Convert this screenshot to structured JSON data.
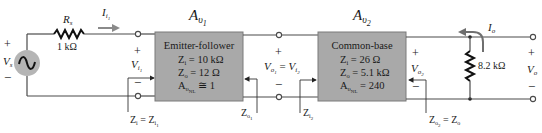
{
  "source": {
    "label": "V",
    "label_sub": "s",
    "plus": "+",
    "minus": "−",
    "fill": "#b5b5b5"
  },
  "source_resistor": {
    "name": "R",
    "name_sub": "s",
    "value": "1 kΩ"
  },
  "input_current": {
    "label": "I",
    "sub": "i",
    "subsub": "1",
    "arrow_color": "#8a8a8a"
  },
  "input_voltage": {
    "plus": "+",
    "minus": "−",
    "label": "V",
    "sub": "i",
    "subsub": "1"
  },
  "input_impedance": {
    "lhs": "Z",
    "lhs_sub": "i",
    "eq": " = ",
    "rhs": "Z",
    "rhs_sub": "i",
    "rhs_subsub": "1"
  },
  "stage1": {
    "gain_label": "A",
    "gain_sub": "υ",
    "gain_subsub": "1",
    "title": "Emitter-follower",
    "zi_sym": "Z",
    "zi_sub": "i",
    "zi_val": " = 10 kΩ",
    "zo_sym": "Z",
    "zo_sub": "o",
    "zo_val": " = 12 Ω",
    "av_sym": "A",
    "av_sub": "υ",
    "av_subsub": "NL",
    "av_val": " ≅ 1",
    "fill": "#a9a9a9"
  },
  "interstage": {
    "plus": "+",
    "minus": "−",
    "lhs": "V",
    "lhs_sub": "o",
    "lhs_subsub": "1",
    "eq": " = ",
    "rhs": "V",
    "rhs_sub": "i",
    "rhs_subsub": "2",
    "zo1": "Z",
    "zo1_sub": "o",
    "zo1_subsub": "1",
    "zi2": "Z",
    "zi2_sub": "i",
    "zi2_subsub": "2"
  },
  "stage2": {
    "gain_label": "A",
    "gain_sub": "υ",
    "gain_subsub": "2",
    "title": "Common-base",
    "zi_sym": "Z",
    "zi_sub": "i",
    "zi_val": " = 26 Ω",
    "zo_sym": "Z",
    "zo_sub": "o",
    "zo_val": " = 5.1 kΩ",
    "av_sym": "A",
    "av_sub": "υ",
    "av_subsub": "NL",
    "av_val": " = 240",
    "fill": "#a9a9a9"
  },
  "stage2_output": {
    "plus": "+",
    "minus": "−",
    "label": "V",
    "sub": "o",
    "subsub": "2",
    "zo2": "Z",
    "zo2_sub": "o",
    "zo2_subsub": "2",
    "eq": " = ",
    "zo": "Z",
    "zo_sub": "o"
  },
  "load": {
    "value": "8.2 kΩ"
  },
  "output": {
    "current": "I",
    "current_sub": "o",
    "plus": "+",
    "minus": "−",
    "label": "V",
    "label_sub": "o"
  }
}
